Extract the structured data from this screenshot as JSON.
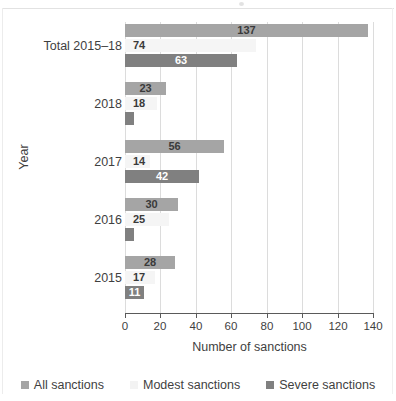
{
  "chart_data": {
    "type": "bar",
    "orientation": "horizontal",
    "title": "",
    "xlabel": "Number of sanctions",
    "ylabel": "Year",
    "xlim": [
      0,
      140
    ],
    "xticks": [
      0,
      20,
      40,
      60,
      80,
      100,
      120,
      140
    ],
    "grid": "vertical",
    "legend_position": "bottom",
    "categories": [
      "Total 2015–18",
      "2018",
      "2017",
      "2016",
      "2015"
    ],
    "series": [
      {
        "name": "All sanctions",
        "color": "#a5a5a5",
        "values": [
          137,
          23,
          56,
          30,
          28
        ],
        "labels": [
          "137",
          "23",
          "56",
          "30",
          "28"
        ]
      },
      {
        "name": "Modest sanctions",
        "color": "#f5f5f5",
        "values": [
          74,
          18,
          14,
          25,
          17
        ],
        "labels": [
          "74",
          "18",
          "14",
          "25",
          "17"
        ]
      },
      {
        "name": "Severe sanctions",
        "color": "#808080",
        "values": [
          63,
          5,
          42,
          5,
          11
        ],
        "labels": [
          "63",
          "",
          "42",
          "",
          "11"
        ]
      }
    ]
  },
  "axis": {
    "x_title": "Number of sanctions",
    "y_title": "Year",
    "tick_labels": [
      "0",
      "20",
      "40",
      "60",
      "80",
      "100",
      "120",
      "140"
    ]
  },
  "legend": {
    "items": [
      {
        "label": "All sanctions",
        "swatch": "#a5a5a5"
      },
      {
        "label": "Modest sanctions",
        "swatch": "#f3f3f3"
      },
      {
        "label": "Severe sanctions",
        "swatch": "#808080"
      }
    ]
  },
  "categories": {
    "0": "Total 2015–18",
    "1": "2018",
    "2": "2017",
    "3": "2016",
    "4": "2015"
  }
}
